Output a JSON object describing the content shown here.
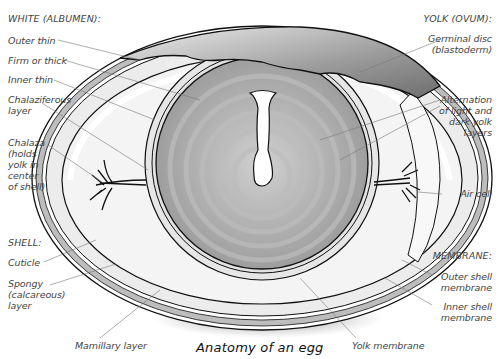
{
  "title": "Anatomy of an egg",
  "sections": {
    "white": {
      "header": "WHITE (ALBUMEN):",
      "items": [
        "Outer thin",
        "Firm or thick",
        "Inner thin",
        "Chalaziferous\nlayer",
        "Chalaza\n(holds\nyolk in\ncenter\nof shell)"
      ]
    },
    "shell": {
      "header": "SHELL:",
      "items": [
        "Cuticle",
        "Spongy\n(calcareous)\nlayer",
        "Mamillary layer"
      ]
    },
    "yolk": {
      "header": "YOLK (OVUM):",
      "items": [
        "Germinal disc\n(blastoderm)",
        "Alternation\nof light and\ndark yolk\nlayers",
        "Yolk membrane"
      ]
    },
    "air": {
      "label": "Air cell"
    },
    "membrane": {
      "header": "MEMBRANE:",
      "items": [
        "Outer shell\nmembrane",
        "Inner shell\nmembrane"
      ]
    }
  },
  "colors": {
    "shell_band": "#bdbdbd",
    "albumen": "#ececec",
    "yolk_light": "#c8c8c8",
    "yolk_dark": "#a8a8a8",
    "outline": "#111111",
    "leader": "#7a7a7a"
  }
}
